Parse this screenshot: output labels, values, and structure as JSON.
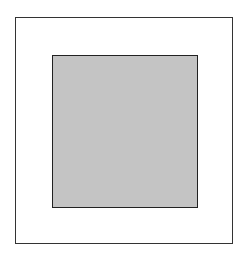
{
  "diagram": {
    "outer_square": {
      "fill": "#ffffff",
      "stroke": "#333333"
    },
    "inner_square": {
      "fill": "#c4c4c4",
      "stroke": "#222222"
    }
  }
}
